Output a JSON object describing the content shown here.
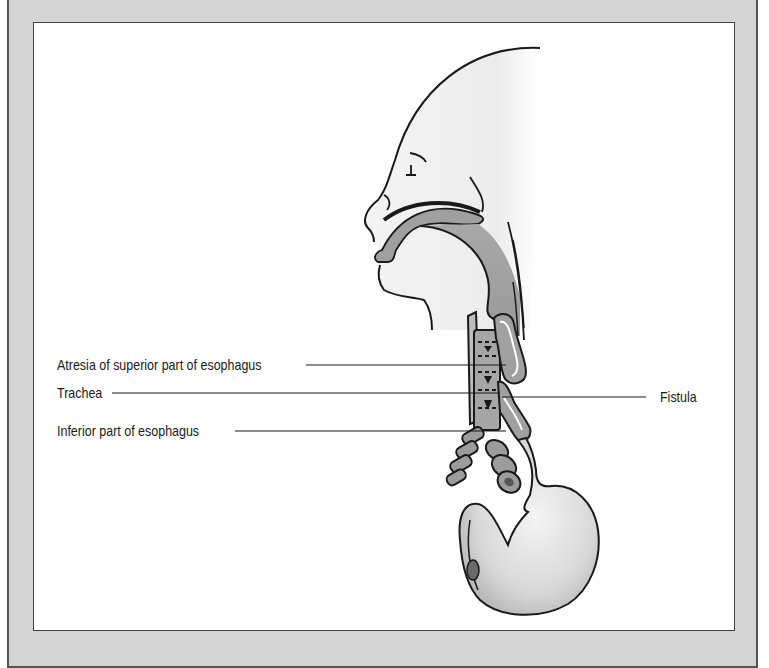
{
  "figure": {
    "labels": {
      "atresia": "Atresia of superior part of esophagus",
      "trachea": "Trachea",
      "inferior": "Inferior part of esophagus",
      "fistula": "Fistula"
    },
    "colors": {
      "frame": "#d4d4d4",
      "panel": "#ffffff",
      "shade": "#9a9a9a",
      "line": "#1a1a1a"
    }
  }
}
